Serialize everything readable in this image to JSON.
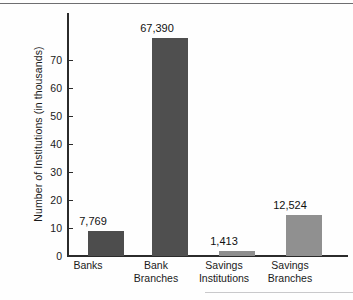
{
  "chart_data": {
    "type": "bar",
    "title": "",
    "subtitle": "",
    "xlabel": "",
    "ylabel": "Number of Institutions (in thousands)",
    "ylim": [
      0,
      75
    ],
    "yticks": [
      0,
      10,
      20,
      30,
      40,
      50,
      60,
      70
    ],
    "ytick_labels": [
      "0",
      "10",
      "20",
      "30",
      "40",
      "50",
      "60",
      "70"
    ],
    "grid": false,
    "legend": "none",
    "units_note": "values are counts of institutions; axis is in thousands",
    "categories": [
      "Banks",
      "Bank Branches",
      "Savings Institutions",
      "Savings Branches"
    ],
    "category_lines": [
      [
        "Banks"
      ],
      [
        "Bank",
        "Branches"
      ],
      [
        "Savings",
        "Institutions"
      ],
      [
        "Savings",
        "Branches"
      ]
    ],
    "values": [
      7769,
      67390,
      1413,
      12524
    ],
    "values_in_thousands": [
      7.769,
      67.39,
      1.413,
      12.524
    ],
    "data_labels": [
      "7,769",
      "67,390",
      "1,413",
      "12,524"
    ],
    "bar_colors": [
      "#4d4d4d",
      "#4f4f4f",
      "#8e8e8e",
      "#909090"
    ],
    "axis_color": "#2b2b2b",
    "background_color": "#fefefe",
    "text_color": "#1a1a1a"
  }
}
